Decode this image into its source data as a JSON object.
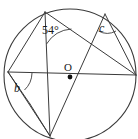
{
  "figure": {
    "type": "circle-geometry-diagram",
    "title": "",
    "background_color": "#ffffff",
    "stroke_color": "#3a3a3a",
    "text_color": "#1a1a1a",
    "circle": {
      "center_label": "O",
      "cx": 70,
      "cy": 75,
      "r": 66
    },
    "center_dot": {
      "label": "O",
      "cx": 70,
      "cy": 77,
      "r": 2.4
    },
    "labels": {
      "angle_54": "54°",
      "angle_c": "c",
      "angle_b": "b",
      "center": "O"
    },
    "points": [
      {
        "name": "top",
        "x": 45,
        "y": 12
      },
      {
        "name": "upper-right",
        "x": 105,
        "y": 14
      },
      {
        "name": "right",
        "x": 136,
        "y": 75
      },
      {
        "name": "left",
        "x": 8,
        "y": 72
      },
      {
        "name": "bottom",
        "x": 50,
        "y": 136
      }
    ],
    "chords": [
      {
        "name": "horizontal-diameter",
        "from": "left",
        "to": "right"
      },
      {
        "name": "vertical-chord",
        "from": "top",
        "to": "bottom"
      },
      {
        "name": "top-to-right",
        "from": "top",
        "to": "right"
      },
      {
        "name": "upperright-to-right",
        "from": "upper-right",
        "to": "right"
      },
      {
        "name": "upperright-to-bottom",
        "from": "upper-right",
        "to": "bottom"
      },
      {
        "name": "left-to-bottom",
        "from": "left",
        "to": "bottom"
      },
      {
        "name": "left-to-bottom-arc",
        "from": "left",
        "to": "bottom-left"
      },
      {
        "name": "left-to-top",
        "from": "left",
        "to": "top"
      }
    ],
    "angle_arcs": [
      {
        "at": "top",
        "label": "54°"
      },
      {
        "at": "upper-right",
        "label": "c"
      },
      {
        "at": "left",
        "label": "b"
      }
    ]
  }
}
